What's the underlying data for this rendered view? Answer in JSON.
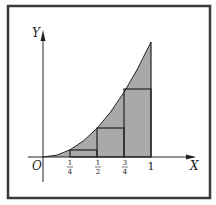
{
  "diagram": {
    "axes": {
      "x_label": "X",
      "y_label": "Y",
      "origin_label": "O"
    },
    "ticks": [
      {
        "num": "1",
        "den": "4",
        "value": 0.25
      },
      {
        "num": "1",
        "den": "2",
        "value": 0.5
      },
      {
        "num": "3",
        "den": "4",
        "value": 0.75
      },
      {
        "label": "1",
        "value": 1
      }
    ],
    "colors": {
      "fill": "#a9a9a9",
      "stroke": "#222222",
      "frame": "#333333",
      "background": "#ffffff"
    }
  }
}
